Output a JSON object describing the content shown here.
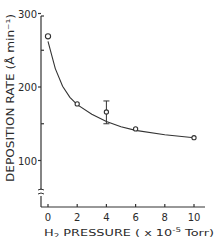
{
  "chart_data": {
    "type": "scatter",
    "title": "",
    "xlabel": "H2 PRESSURE ( x 10^-5 Torr)",
    "xlabel_parts": {
      "h": "H",
      "sub": "2",
      "rest": " PRESSURE ( x 10",
      "sup": "-5",
      "unit": " Torr)"
    },
    "ylabel": "DEPOSITION RATE (Å min⁻¹)",
    "x_ticks": [
      "0",
      "2",
      "4",
      "6",
      "8",
      "10"
    ],
    "x_tick_values": [
      0,
      2,
      4,
      6,
      8,
      10
    ],
    "y_ticks": [
      "100",
      "200",
      "300"
    ],
    "y_tick_values": [
      100,
      200,
      300
    ],
    "xlim": [
      -0.5,
      11
    ],
    "ylim": [
      100,
      300
    ],
    "axis_break": true,
    "grid": false,
    "legend": null,
    "series": [
      {
        "name": "Deposition rate",
        "marker": "open-circle",
        "x": [
          0,
          2,
          4,
          6,
          10
        ],
        "y": [
          269,
          177,
          166,
          143,
          131
        ],
        "error_bars": [
          null,
          null,
          [
            150,
            181
          ],
          null,
          null
        ]
      }
    ],
    "fit_curve": {
      "style": "solid",
      "x": [
        0,
        0.5,
        1,
        1.5,
        2,
        3,
        4,
        5,
        6,
        8,
        10
      ],
      "y": [
        262,
        225,
        201,
        186,
        176,
        163,
        153,
        146,
        141,
        135,
        131
      ]
    }
  }
}
